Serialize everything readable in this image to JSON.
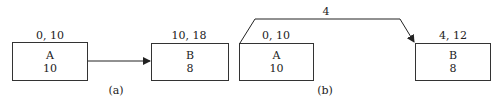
{
  "diagram_a": {
    "caption": "(a)",
    "node_a": {
      "name": "A",
      "duration": "10",
      "times": "0, 10"
    },
    "node_b": {
      "name": "B",
      "duration": "8",
      "times": "10, 18"
    }
  },
  "diagram_b": {
    "caption": "(b)",
    "lead_label": "4",
    "node_a": {
      "name": "A",
      "duration": "10",
      "times": "0, 10"
    },
    "node_b": {
      "name": "B",
      "duration": "8",
      "times": "4, 12"
    }
  }
}
